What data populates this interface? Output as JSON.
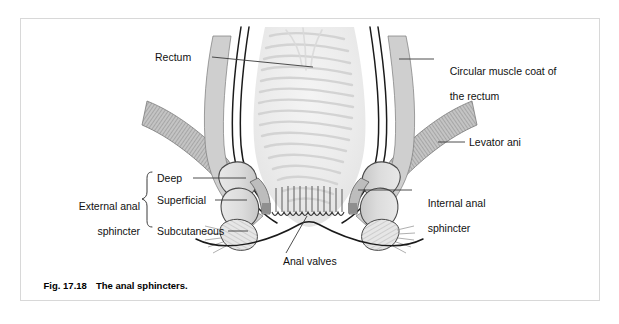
{
  "figure": {
    "caption_number": "Fig. 17.18",
    "caption_text": "The anal sphincters.",
    "frame_color": "#d8d8d8",
    "background": "#ffffff"
  },
  "labels": {
    "rectum": "Rectum",
    "circular_muscle_line1": "Circular muscle coat of",
    "circular_muscle_line2": "the rectum",
    "levator_ani": "Levator ani",
    "internal_sphincter_line1": "Internal anal",
    "internal_sphincter_line2": "sphincter",
    "external_sphincter_line1": "External anal",
    "external_sphincter_line2": "sphincter",
    "deep": "Deep",
    "superficial": "Superficial",
    "subcutaneous": "Subcutaneous",
    "anal_valves": "Anal valves"
  },
  "colors": {
    "outline": "#1a1a1a",
    "leader_line": "#3a3a3a",
    "muscle_coat_fill": "#cfcfcf",
    "levator_fill": "#b9b9b9",
    "sphincter_fill": "#dcdcdc",
    "internal_sphincter_fill": "#c9c9c9",
    "lumen_fill": "#ececec",
    "mucosal_fold": "#d6d6d6",
    "text": "#111111"
  },
  "structures": [
    "rectal lumen with mucosal folds",
    "circular muscle coat of rectum",
    "levator ani muscle (hatched band)",
    "deep external anal sphincter",
    "superficial external anal sphincter",
    "subcutaneous external anal sphincter",
    "internal anal sphincter",
    "anal columns",
    "anal valves"
  ]
}
